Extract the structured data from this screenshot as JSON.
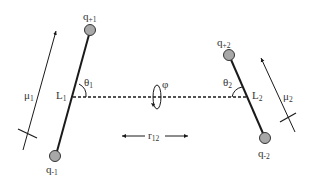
{
  "diagram": {
    "type": "quadrupole/dipole interaction geometry",
    "colors": {
      "line": "#1a1a1a",
      "charge_fill": "#a8a8a8",
      "charge_stroke": "#333333",
      "text": "#333333",
      "background": "#ffffff"
    },
    "molecule_1": {
      "positive_charge": {
        "base": "q",
        "sub": "+1"
      },
      "negative_charge": {
        "base": "q",
        "sub": "-1"
      },
      "center": {
        "base": "L",
        "sub": "1"
      },
      "angle": {
        "base": "θ",
        "sub": "1"
      },
      "dipole": {
        "base": "μ",
        "sub": "1"
      }
    },
    "molecule_2": {
      "positive_charge": {
        "base": "q",
        "sub": "+2"
      },
      "negative_charge": {
        "base": "q",
        "sub": "-2"
      },
      "center": {
        "base": "L",
        "sub": "2"
      },
      "angle": {
        "base": "θ",
        "sub": "2"
      },
      "dipole": {
        "base": "μ",
        "sub": "2"
      }
    },
    "torsion": {
      "symbol": "φ"
    },
    "separation": {
      "base": "r",
      "sub": "12"
    }
  }
}
